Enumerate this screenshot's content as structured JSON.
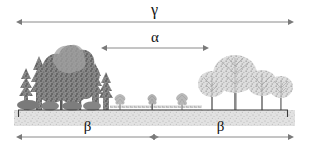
{
  "figure": {
    "background_color": "#ffffff",
    "width": 309,
    "height": 152
  },
  "labels": {
    "gamma": "γ",
    "alpha": "α",
    "beta_left": "β",
    "beta_right": "β"
  },
  "measures": [
    {
      "name": "gamma",
      "symbol": "γ",
      "arrow": "double-headed",
      "x_start": 22,
      "x_end": 288,
      "y": 22,
      "label_y": 10,
      "span_description": "entire landscape"
    },
    {
      "name": "alpha",
      "symbol": "α",
      "arrow": "double-headed",
      "x_start": 107,
      "x_end": 203,
      "y": 48,
      "label_y": 37,
      "span_description": "central clearing habitat"
    },
    {
      "name": "beta-left",
      "symbol": "β",
      "arrow": "double-headed",
      "x_start": 22,
      "x_end": 153,
      "y": 137,
      "label_y": 126,
      "span_description": "dense dark forest to clearing midpoint"
    },
    {
      "name": "beta-right",
      "symbol": "β",
      "arrow": "double-headed",
      "x_start": 153,
      "x_end": 288,
      "y": 137,
      "label_y": 126,
      "span_description": "clearing midpoint to open woodland"
    }
  ],
  "colors": {
    "arrow_line": "#8a8a8a",
    "arrow_head": "#7a7a7a",
    "label_text": "#111111",
    "ground_line": "#3a3a3a",
    "soil_band": "#cfcfcf",
    "dense_forest_dark": "#6f6f6f",
    "dense_forest_mid": "#8c8c8c",
    "dense_forest_light": "#a8a8a8",
    "open_woodland": "#b4b4b4",
    "open_woodland_trunk": "#8f8f8f",
    "sapling": "#b9b9b9"
  },
  "ground": {
    "line_y": 110,
    "x_start": 18,
    "x_end": 288,
    "end_tick_height": 7,
    "soil_band_top": 110,
    "soil_band_bottom": 126,
    "texture": "stippled"
  },
  "vegetation": {
    "left_stand": {
      "name": "dense-dark-forest",
      "x_start": 18,
      "x_end": 108,
      "canopy_top_y": 33,
      "tone": "dark",
      "description": "closed canopy mixed conifer and broadleaf stand",
      "trees": [
        {
          "x": 24,
          "crown_w": 20,
          "top_y": 58,
          "type": "conifer"
        },
        {
          "x": 38,
          "crown_w": 26,
          "top_y": 48,
          "type": "conifer"
        },
        {
          "x": 58,
          "crown_w": 40,
          "top_y": 33,
          "type": "broadleaf"
        },
        {
          "x": 80,
          "crown_w": 30,
          "top_y": 45,
          "type": "broadleaf"
        },
        {
          "x": 96,
          "crown_w": 22,
          "top_y": 55,
          "type": "conifer"
        },
        {
          "x": 105,
          "crown_w": 16,
          "top_y": 66,
          "type": "conifer"
        }
      ]
    },
    "clearing": {
      "name": "open-clearing",
      "x_start": 110,
      "x_end": 202,
      "description": "low herbaceous clearing with scattered saplings",
      "saplings": [
        {
          "x": 120,
          "height": 16
        },
        {
          "x": 152,
          "height": 14
        },
        {
          "x": 182,
          "height": 16
        }
      ]
    },
    "right_stand": {
      "name": "open-woodland",
      "x_start": 200,
      "x_end": 290,
      "canopy_top_y": 55,
      "tone": "light",
      "description": "sparse deciduous woodland with visible trunks",
      "trees": [
        {
          "x": 212,
          "crown_w": 28,
          "top_y": 72,
          "type": "deciduous"
        },
        {
          "x": 235,
          "crown_w": 44,
          "top_y": 55,
          "type": "deciduous"
        },
        {
          "x": 262,
          "crown_w": 30,
          "top_y": 70,
          "type": "deciduous"
        },
        {
          "x": 281,
          "crown_w": 24,
          "top_y": 76,
          "type": "deciduous"
        }
      ]
    }
  }
}
